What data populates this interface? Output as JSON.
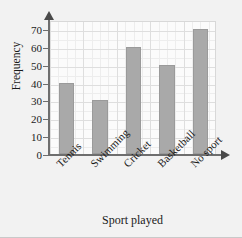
{
  "chart_data": {
    "type": "bar",
    "title": "",
    "subtitle": "",
    "xlabel": "Sport played",
    "ylabel": "Frequency",
    "categories": [
      "Tennis",
      "Swimming",
      "Cricket",
      "Basketball",
      "No sport"
    ],
    "values": [
      40,
      30,
      60,
      50,
      70
    ],
    "series": [
      {
        "name": "Frequency",
        "values": [
          40,
          30,
          60,
          50,
          70
        ]
      }
    ],
    "ylim": [
      0,
      75
    ],
    "xlim": [
      0,
      5
    ],
    "ytick_labels": [
      "0",
      "10",
      "20",
      "30",
      "40",
      "50",
      "60",
      "70"
    ],
    "ytick_values": [
      0,
      10,
      20,
      30,
      40,
      50,
      60,
      70
    ],
    "ytick_step": 10,
    "grid": true,
    "grid_minor": true,
    "legend": false,
    "legend_position": "none",
    "annotations": [],
    "colors": {
      "bar_fill": "#a9a9a9",
      "bar_stroke": "#9a9a9a",
      "axis": "#6e6e6e",
      "grid_major": "#dedede",
      "grid_minor": "#ededed",
      "plot_background": "#fbfbfb",
      "figure_background": "#f2f2f2",
      "text": "#1a1a1a"
    }
  },
  "axis": {
    "y_title": "Frequency",
    "x_title": "Sport played",
    "y_arrow": "arrow-up-icon",
    "x_arrow": "arrow-right-icon"
  }
}
